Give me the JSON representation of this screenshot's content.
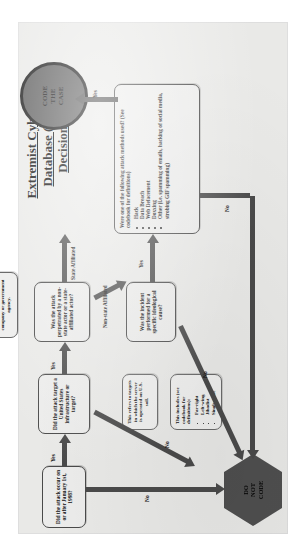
{
  "title": {
    "line1": "Extremist Cybercrime",
    "line2": "Database (ECCD)",
    "line3": "Decision-tree"
  },
  "nodes": {
    "q1": "Did the attack occur on or after January 1st, 1998?",
    "q2": "Did the attack target a United States infrastructure or target?",
    "q3": "Was the attack perpetrated by a non-state actor or a state-affiliated actor?",
    "q4": "Was the incident performed for a specific ideological cause?",
    "q5": "Were one of the following attack methods used? (See codebook for definitions)"
  },
  "method_list": [
    "Hack",
    "Data Breach",
    "Web Defacement",
    "Doxxing",
    "Other (i.e. spamming of emails, hacking of social media, strobing GIF spamming)"
  ],
  "notes": {
    "state_note": "This includes both formal or informal ties to a national government, intelligence agency, or military unit. The attribution may be made by a cybersecurity company or government agency.",
    "target_note": "This refers to targets in which the server is operated on U.S. soil.",
    "ideology_note_intro": "This includes (see codebook for definitions):",
    "ideology_list": [
      "Far-right",
      "Left-wing",
      "Jihadist",
      "Single-issue"
    ]
  },
  "terminals": {
    "code_the_case": [
      "CODE",
      "THE",
      "CASE"
    ],
    "do_not_code": [
      "DO",
      "NOT",
      "CODE"
    ]
  },
  "edge_labels": {
    "yes_1": "Yes",
    "yes_2": "Yes",
    "yes_3": "Yes",
    "yes_4": "Yes",
    "no_1": "No",
    "no_2": "No",
    "no_3": "No",
    "no_4": "No",
    "state_affiliated": "State Affiliated",
    "non_state_affiliated": "Non-state Affiliated"
  },
  "colors": {
    "paper": "#e9e9e7",
    "node_fill": "#ececeb",
    "node_stroke": "#4a4a4a",
    "arrow": "#4a4a4a",
    "terminal_fill": "#565656",
    "terminal_stroke": "#0d0d0d"
  }
}
